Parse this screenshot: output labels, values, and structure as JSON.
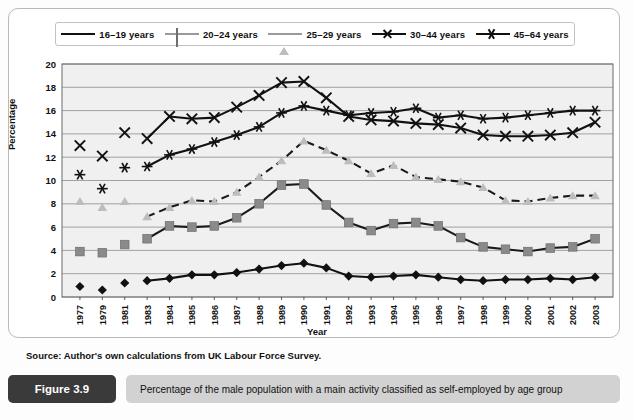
{
  "figure": {
    "tag": "Figure 3.9",
    "caption": "Percentage of the male population with a main activity classified as self-employed by age group",
    "source": "Source: Author's own calculations from UK Labour Force Survey."
  },
  "chart_data": {
    "type": "line",
    "title": "Percentage of the male population with a main activity classified as self-employed by age group",
    "xlabel": "Year",
    "ylabel": "Percentage",
    "ylim": [
      0,
      20
    ],
    "ytick_step": 2,
    "yticks": [
      0,
      2,
      4,
      6,
      8,
      10,
      12,
      14,
      16,
      18,
      20
    ],
    "grid": true,
    "legend_position": "top",
    "x": [
      1977,
      1979,
      1981,
      1983,
      1984,
      1985,
      1986,
      1987,
      1988,
      1989,
      1990,
      1991,
      1992,
      1993,
      1994,
      1995,
      1996,
      1997,
      1998,
      1999,
      2000,
      2001,
      2002,
      2003
    ],
    "gap_after_index": 2,
    "series": [
      {
        "name": "16–19 years",
        "marker": "diamond",
        "color": "#111111",
        "style": "solid",
        "values": [
          0.9,
          0.6,
          1.2,
          1.4,
          1.6,
          1.9,
          1.9,
          2.1,
          2.4,
          2.7,
          2.9,
          2.5,
          1.8,
          1.7,
          1.8,
          1.9,
          1.7,
          1.5,
          1.4,
          1.5,
          1.5,
          1.6,
          1.5,
          1.7
        ]
      },
      {
        "name": "20–24 years",
        "marker": "square",
        "color": "#8a8a8a",
        "style": "solid",
        "values": [
          3.9,
          3.8,
          4.5,
          5.0,
          6.1,
          6.0,
          6.1,
          6.8,
          8.0,
          9.6,
          9.7,
          7.9,
          6.4,
          5.7,
          6.3,
          6.4,
          6.1,
          5.1,
          4.3,
          4.1,
          3.9,
          4.2,
          4.3,
          5.0
        ]
      },
      {
        "name": "25–29 years",
        "marker": "triangle",
        "color": "#bdbdbd",
        "style": "dashed",
        "values": [
          8.2,
          7.7,
          8.2,
          6.9,
          7.7,
          8.3,
          8.2,
          9.0,
          10.3,
          11.7,
          13.4,
          12.6,
          11.7,
          10.6,
          11.3,
          10.3,
          10.1,
          9.9,
          9.4,
          8.3,
          8.2,
          8.5,
          8.7,
          8.7
        ]
      },
      {
        "name": "30–44 years",
        "marker": "x",
        "color": "#111111",
        "style": "solid",
        "values": [
          13.0,
          12.1,
          14.1,
          13.6,
          15.5,
          15.3,
          15.4,
          16.3,
          17.3,
          18.4,
          18.5,
          17.1,
          15.5,
          15.2,
          15.1,
          14.9,
          14.8,
          14.5,
          13.9,
          13.8,
          13.8,
          13.9,
          14.1,
          15.0
        ]
      },
      {
        "name": "45–64 years",
        "marker": "asterisk",
        "color": "#111111",
        "style": "solid",
        "values": [
          10.5,
          9.3,
          11.1,
          11.2,
          12.2,
          12.7,
          13.3,
          13.9,
          14.6,
          15.8,
          16.4,
          16.0,
          15.6,
          15.8,
          15.9,
          16.2,
          15.4,
          15.6,
          15.3,
          15.4,
          15.6,
          15.8,
          16.0,
          16.0
        ]
      }
    ]
  },
  "legend": {
    "items": [
      {
        "label": "16–19 years",
        "marker": "diamond-marker"
      },
      {
        "label": "20–24 years",
        "marker": "square-marker"
      },
      {
        "label": "25–29 years",
        "marker": "triangle-marker"
      },
      {
        "label": "30–44 years",
        "marker": "x-marker"
      },
      {
        "label": "45–64 years",
        "marker": "asterisk-marker"
      }
    ]
  }
}
